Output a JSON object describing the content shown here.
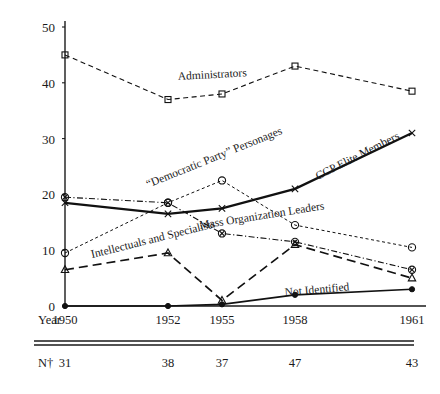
{
  "chart_data": {
    "type": "line",
    "title": "",
    "subtitle": "",
    "xlabel": "Year",
    "ylabel": "",
    "x": [
      1950,
      1952,
      1955,
      1958,
      1961
    ],
    "categories": [
      "1950",
      "1952",
      "1955",
      "1958",
      "1961"
    ],
    "xtick_labels": [
      "1950",
      "1952",
      "1955",
      "1958",
      "1961"
    ],
    "ytick_labels": [
      "0",
      "10",
      "20",
      "30",
      "40",
      "50"
    ],
    "ytick_values": [
      0,
      10,
      20,
      30,
      40,
      50
    ],
    "ylim": [
      0,
      50
    ],
    "grid": false,
    "legend": "inline-labels",
    "series": [
      {
        "name": "Administrators",
        "marker": "open-square",
        "linestyle": "dashed",
        "values": [
          45.0,
          37.0,
          38.0,
          43.0,
          38.5
        ]
      },
      {
        "name": "“Democratic Party” Personages",
        "marker": "open-circle",
        "linestyle": "fine-dashed",
        "values": [
          9.5,
          18.5,
          22.5,
          14.5,
          10.5
        ]
      },
      {
        "name": "Mass Organization Leaders",
        "marker": "circled-x",
        "linestyle": "dash-dot",
        "values": [
          19.5,
          18.5,
          13.0,
          11.5,
          6.5
        ]
      },
      {
        "name": "CCP Elite Members",
        "marker": "x-cross",
        "linestyle": "solid-bold",
        "values": [
          18.5,
          16.5,
          17.5,
          21.0,
          31.0
        ]
      },
      {
        "name": "Intellectuals and Specialists",
        "marker": "open-triangle",
        "linestyle": "long-dash",
        "values": [
          6.5,
          9.5,
          1.0,
          11.0,
          5.0
        ]
      },
      {
        "name": "Not Identified",
        "marker": "filled-circle",
        "linestyle": "solid",
        "values": [
          0.0,
          0.0,
          0.3,
          2.0,
          3.0
        ]
      }
    ],
    "footer_row": {
      "header": "N†",
      "values": [
        "31",
        "38",
        "37",
        "47",
        "43"
      ]
    }
  },
  "axis": {
    "year_row_label": "Year"
  }
}
